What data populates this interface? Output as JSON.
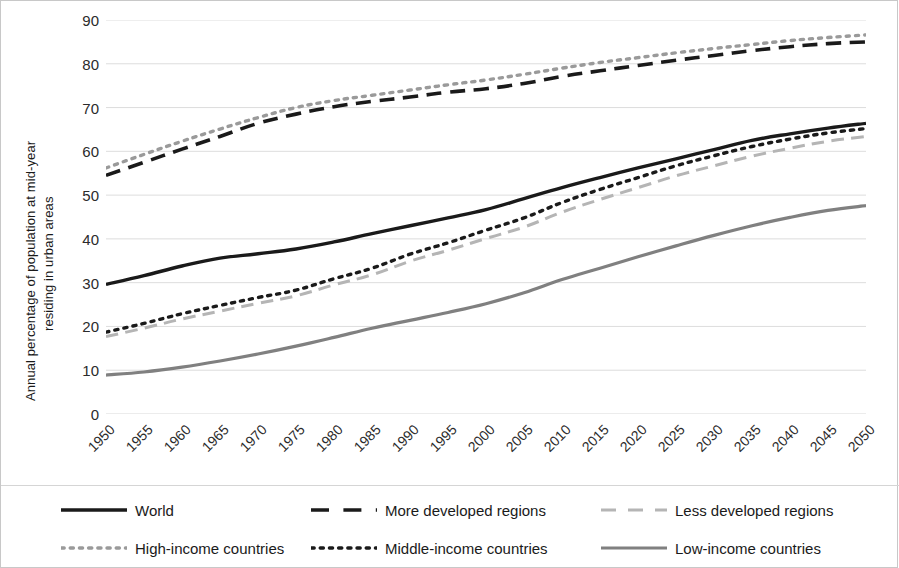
{
  "chart_data": {
    "type": "line",
    "title": "",
    "xlabel": "",
    "ylabel": "Annual percentage of population at mid-year residing in urban areas",
    "ylabel_line1": "Annual percentage of population at mid-year",
    "ylabel_line2": "residing in urban areas",
    "ylim": [
      0,
      90
    ],
    "ytick_labels": [
      "0",
      "10",
      "20",
      "30",
      "40",
      "50",
      "60",
      "70",
      "80",
      "90"
    ],
    "ytick_values": [
      0,
      10,
      20,
      30,
      40,
      50,
      60,
      70,
      80,
      90
    ],
    "grid": true,
    "grid_color": "#d9d9d9",
    "legend_position": "bottom",
    "x": [
      1950,
      1955,
      1960,
      1965,
      1970,
      1975,
      1980,
      1985,
      1990,
      1995,
      2000,
      2005,
      2010,
      2015,
      2020,
      2025,
      2030,
      2035,
      2040,
      2045,
      2050
    ],
    "categories": [
      "1950",
      "1955",
      "1960",
      "1965",
      "1970",
      "1975",
      "1980",
      "1985",
      "1990",
      "1995",
      "2000",
      "2005",
      "2010",
      "2015",
      "2020",
      "2025",
      "2030",
      "2035",
      "2040",
      "2045",
      "2050"
    ],
    "series": [
      {
        "name": "World",
        "color": "#1a1a1a",
        "style": "solid",
        "width": 3.4,
        "values": [
          29.6,
          31.6,
          33.8,
          35.6,
          36.6,
          37.7,
          39.3,
          41.2,
          43.0,
          44.8,
          46.7,
          49.2,
          51.7,
          54.0,
          56.2,
          58.3,
          60.4,
          62.5,
          64.0,
          65.3,
          66.4
        ]
      },
      {
        "name": "More developed regions",
        "color": "#1a1a1a",
        "style": "dashed",
        "width": 3.6,
        "values": [
          54.5,
          57.5,
          60.5,
          63.4,
          66.4,
          68.5,
          70.2,
          71.4,
          72.4,
          73.5,
          74.3,
          75.5,
          77.1,
          78.4,
          79.6,
          80.8,
          81.9,
          83.0,
          83.9,
          84.6,
          85.0
        ]
      },
      {
        "name": "Less developed regions",
        "color": "#b5b5b5",
        "style": "dashed",
        "width": 3.0,
        "values": [
          17.7,
          19.6,
          21.7,
          23.5,
          25.3,
          27.0,
          29.5,
          31.8,
          34.9,
          37.4,
          40.1,
          42.7,
          46.1,
          49.0,
          51.7,
          54.4,
          56.7,
          58.9,
          60.7,
          62.3,
          63.4
        ]
      },
      {
        "name": "High-income countries",
        "color": "#9a9a9a",
        "style": "dotted",
        "width": 3.4,
        "values": [
          56.2,
          59.3,
          62.3,
          65.1,
          67.7,
          70.0,
          71.6,
          72.8,
          74.0,
          75.2,
          76.3,
          77.6,
          79.0,
          80.3,
          81.4,
          82.5,
          83.5,
          84.4,
          85.3,
          86.0,
          86.6
        ]
      },
      {
        "name": "Middle-income countries",
        "color": "#1a1a1a",
        "style": "dotted",
        "width": 3.4,
        "values": [
          18.7,
          20.7,
          22.9,
          24.8,
          26.6,
          28.3,
          30.9,
          33.3,
          36.5,
          39.1,
          42.0,
          44.8,
          48.3,
          51.3,
          54.0,
          56.7,
          59.0,
          61.1,
          62.8,
          64.2,
          65.2
        ]
      },
      {
        "name": "Low-income countries",
        "color": "#808080",
        "style": "solid",
        "width": 3.2,
        "values": [
          8.9,
          9.6,
          10.7,
          12.1,
          13.7,
          15.5,
          17.5,
          19.6,
          21.4,
          23.2,
          25.2,
          27.7,
          30.7,
          33.3,
          35.9,
          38.4,
          40.8,
          43.0,
          44.9,
          46.5,
          47.6
        ]
      }
    ]
  },
  "legend": {
    "rows": [
      [
        {
          "label": "World",
          "series": "World"
        },
        {
          "label": "More developed regions",
          "series": "More developed regions"
        },
        {
          "label": "Less developed regions",
          "series": "Less developed regions"
        }
      ],
      [
        {
          "label": "High-income countries",
          "series": "High-income countries"
        },
        {
          "label": "Middle-income countries",
          "series": "Middle-income countries"
        },
        {
          "label": "Low-income countries",
          "series": "Low-income countries"
        }
      ]
    ]
  }
}
